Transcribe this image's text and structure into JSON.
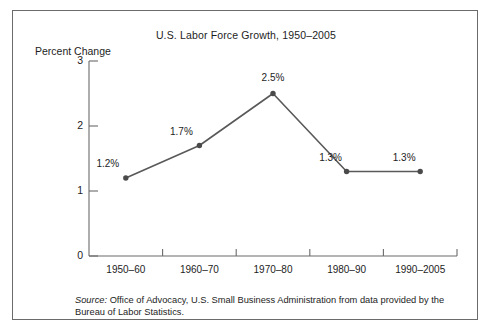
{
  "figure": {
    "title": "U.S. Labor Force Growth, 1950–2005",
    "y_axis_title": "Percent Change",
    "source_label": "Source:",
    "source_text": " Office of Advocacy, U.S. Small Business Administration from data provided by the Bureau of Labor Statistics.",
    "border_color": "#6b6b6b",
    "line_color": "#595959",
    "marker_color": "#4a4a4a",
    "text_color": "#1d1d1d",
    "background": "#ffffff"
  },
  "chart_data": {
    "type": "line",
    "title": "U.S. Labor Force Growth, 1950–2005",
    "xlabel": "",
    "ylabel": "Percent Change",
    "categories": [
      "1950–60",
      "1960–70",
      "1970–80",
      "1980–90",
      "1990–2005"
    ],
    "values": [
      1.2,
      1.7,
      2.5,
      1.3,
      1.3
    ],
    "point_labels": [
      "1.2%",
      "1.7%",
      "2.5%",
      "1.3%",
      "1.3%"
    ],
    "ylim": [
      0,
      3
    ],
    "yticks": [
      0,
      1,
      2,
      3
    ],
    "ytick_labels": [
      "0",
      "1",
      "2",
      "3"
    ],
    "grid": false,
    "legend": null,
    "marker": "circle",
    "annotations": [
      "Source: Office of Advocacy, U.S. Small Business Administration from data provided by the Bureau of Labor Statistics."
    ]
  }
}
